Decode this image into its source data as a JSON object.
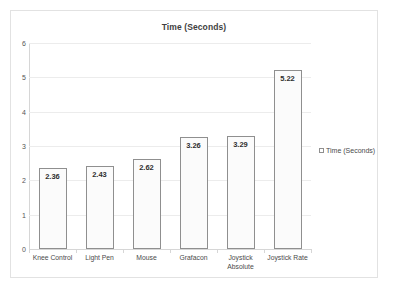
{
  "chart_data": {
    "type": "bar",
    "title": "Time (Seconds)",
    "xlabel": "",
    "ylabel": "",
    "categories": [
      "Knee Control",
      "Light Pen",
      "Mouse",
      "Grafacon",
      "Joystick Absolute",
      "Joystick Rate"
    ],
    "values": [
      2.36,
      2.43,
      2.62,
      3.26,
      3.29,
      5.22
    ],
    "value_labels": [
      "2.36",
      "2.43",
      "2.62",
      "3.26",
      "3.29",
      "5.22"
    ],
    "series": [
      {
        "name": "Time (Seconds)",
        "values": [
          2.36,
          2.43,
          2.62,
          3.26,
          3.29,
          5.22
        ]
      }
    ],
    "ylim": [
      0,
      6
    ],
    "yticks": [
      0,
      1,
      2,
      3,
      4,
      5,
      6
    ],
    "ytick_labels": [
      "0",
      "1",
      "2",
      "3",
      "4",
      "5",
      "6"
    ],
    "grid": true,
    "grid_axis": "y",
    "legend": {
      "position": "right",
      "entries": [
        {
          "label": "Time (Seconds)",
          "marker": "legend-square-marker"
        }
      ]
    },
    "colors": {
      "bar_fill": "#fbfbfb",
      "bar_border": "#8f8f8f",
      "gridline": "#ececec",
      "axis_line": "#d6d6d6",
      "frame_border": "#e2e2e2",
      "background": "#ffffff",
      "title_text": "#3f3f3f",
      "label_text": "#4a4a4a"
    }
  }
}
